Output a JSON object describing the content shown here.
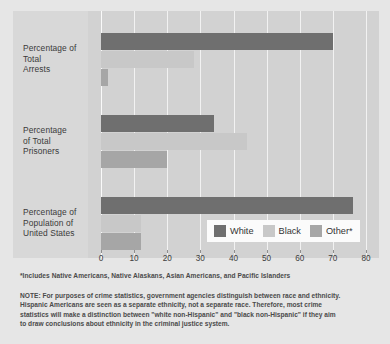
{
  "chart_data": {
    "type": "bar",
    "orientation": "horizontal",
    "title": "",
    "xlabel": "",
    "ylabel": "",
    "xlim": [
      0,
      80
    ],
    "xticks": [
      "0",
      "10",
      "20",
      "30",
      "40",
      "50",
      "60",
      "70",
      "80"
    ],
    "grid": true,
    "legend_position": "inside-bottom-right",
    "categories": [
      "Percentage of Total Arrests",
      "Percentage of Total Prisoners",
      "Percentage of Population of United States"
    ],
    "category_label_lines": [
      [
        "Percentage of",
        "Total",
        "Arrests"
      ],
      [
        "Percentage",
        "of Total",
        "Prisoners"
      ],
      [
        "Percentage of",
        "Population of",
        "United States"
      ]
    ],
    "series": [
      {
        "name": "White",
        "color": "#6f6f6f",
        "values": [
          70,
          34,
          76
        ]
      },
      {
        "name": "Black",
        "color": "#c8c8c8",
        "values": [
          28,
          44,
          12
        ]
      },
      {
        "name": "Other*",
        "color": "#a6a6a6",
        "values": [
          2,
          20,
          12
        ]
      }
    ],
    "footnote": "*Includes Native Americans, Native Alaskans, Asian Americans, and Pacific Islanders",
    "note_lines": [
      "NOTE: For purposes of crime statistics, government agencies distinguish between race and ethnicity.",
      "Hispanic Americans are seen as a separate ethnicity, not a separate race.  Therefore, most crime",
      "statistics will make a distinction between \"white non-Hispanic\" and \"black non-Hispanic\" if they aim",
      "to draw conclusions about ethnicity in the criminal justice system."
    ]
  },
  "colors": {
    "page_background": "#e6e6e6",
    "plot_background": "#d2d2d2",
    "label_gutter": "#d8d8d8",
    "gridline": "#f2f2f2",
    "legend_background": "#fbfbfb",
    "text": "#3a3a3a"
  }
}
